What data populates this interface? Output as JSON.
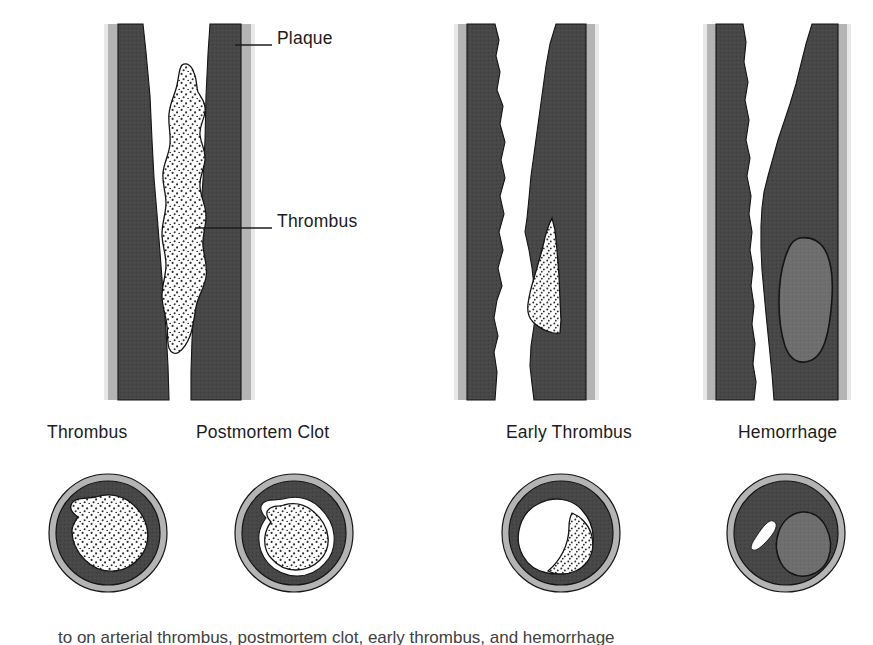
{
  "figure": {
    "kind": "medical-illustration",
    "background_color": "#ffffff"
  },
  "callouts": [
    {
      "id": "plaque",
      "label": "Plaque",
      "text_x": 277,
      "text_y": 30,
      "line_x1": 235,
      "line_y1": 45,
      "line_x2": 272,
      "line_y2": 45
    },
    {
      "id": "thrombus",
      "label": "Thrombus",
      "text_x": 277,
      "text_y": 213,
      "line_x1": 195,
      "line_y1": 228,
      "line_x2": 272,
      "line_y2": 228
    }
  ],
  "panels": [
    {
      "id": "thrombus",
      "label": "Thrombus",
      "label_x": 47,
      "label_y": 424,
      "cross_section": {
        "cx": 108,
        "cy": 533,
        "r_outer": 59,
        "r_inner": 52,
        "lumen_fill": "stipple",
        "has_halo": false,
        "content_desc": "Stippled thrombus mass completely filling and adherent to the lumen"
      }
    },
    {
      "id": "postmortem-clot",
      "label": "Postmortem Clot",
      "label_x": 196,
      "label_y": 424,
      "cross_section": {
        "cx": 294,
        "cy": 533,
        "r_outer": 59,
        "r_inner": 52,
        "lumen_fill": "stipple",
        "has_halo": true,
        "content_desc": "Stippled clot shrunken away from the wall leaving a clear white halo"
      }
    },
    {
      "id": "early-thrombus",
      "label": "Early Thrombus",
      "label_x": 506,
      "label_y": 424,
      "cross_section": {
        "cx": 561,
        "cy": 533,
        "r_outer": 59,
        "r_inner": 52,
        "lumen_fill": "white-with-stipple-crescent",
        "has_halo": false,
        "content_desc": "Open white lumen with a small stippled mural thrombus on one side"
      }
    },
    {
      "id": "hemorrhage",
      "label": "Hemorrhage",
      "label_x": 738,
      "label_y": 424,
      "cross_section": {
        "cx": 786,
        "cy": 533,
        "r_outer": 59,
        "r_inner": 52,
        "lumen_fill": "slit-and-gray-blob",
        "has_halo": false,
        "content_desc": "Slit-like residual lumen beside a mid-gray hemorrhage within the plaque"
      }
    }
  ],
  "longitudinal_views": [
    {
      "id": "thrombus-longitudinal",
      "covers_labels": [
        "Thrombus",
        "Postmortem Clot"
      ],
      "description": "Artery in long section almost occluded by a large tapering stippled thrombus"
    },
    {
      "id": "early-thrombus-longitudinal",
      "covers_labels": [
        "Early Thrombus"
      ],
      "description": "Artery with eccentric plaque and a small stippled mural thrombus low on the right wall"
    },
    {
      "id": "hemorrhage-longitudinal",
      "covers_labels": [
        "Hemorrhage"
      ],
      "description": "Artery with eccentric plaque containing a mid-gray oval of intraplaque hemorrhage"
    }
  ],
  "colors": {
    "background": "#ffffff",
    "adventitia": "#b4b4b4",
    "plaque_dark": "#474747",
    "hemorrhage_gray": "#6e6e6e",
    "lumen_white": "#ffffff",
    "outline": "#141414",
    "text": "#1c1c1c",
    "stipple_dot": "#2b2b2b"
  },
  "caption": {
    "clipped": true,
    "text": "to on arterial thrombus, postmortem clot, early thrombus, and hemorrhage"
  }
}
